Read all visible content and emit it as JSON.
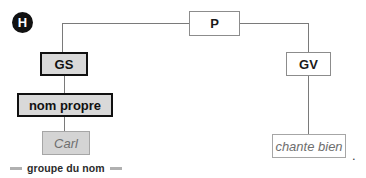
{
  "figure": {
    "label_badge": "H",
    "caption": "groupe du nom",
    "sentence_period": ".",
    "colors": {
      "line": "#7a7a7a",
      "heavy_border": "#111111",
      "heavy_fill": "#d9d9d9",
      "thin_border": "#8c8c8c",
      "leaf_text": "#6e6e6e",
      "leaf_fill": "#d4d4d4",
      "badge_fill": "#111111",
      "caption_dash": "#b0b0b0"
    }
  },
  "tree": {
    "root": {
      "label": "P"
    },
    "nodes": [
      {
        "id": "gs",
        "label": "GS",
        "style": "heavy"
      },
      {
        "id": "nom_propre",
        "label": "nom propre",
        "style": "heavy"
      },
      {
        "id": "carl",
        "label": "Carl",
        "style": "leaf-gray"
      },
      {
        "id": "gv",
        "label": "GV",
        "style": "thin"
      },
      {
        "id": "chante_bien",
        "label": "chante bien",
        "style": "leaf-white"
      }
    ]
  }
}
